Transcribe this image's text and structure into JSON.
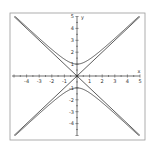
{
  "chart_data": {
    "type": "line",
    "title": "",
    "xlabel": "x",
    "ylabel": "y",
    "xlim": [
      -5,
      5
    ],
    "ylim": [
      -5,
      5
    ],
    "x_ticks": [
      -4,
      -3,
      -2,
      -1,
      1,
      2,
      3,
      4,
      5
    ],
    "y_ticks": [
      -4,
      -3,
      -2,
      -1,
      1,
      2,
      3,
      4,
      5
    ],
    "grid": false,
    "legend": null,
    "series": [
      {
        "name": "hyperbola upper branch",
        "equation": "y = sqrt(1 + x^2)",
        "x": [
          -5,
          -4,
          -3,
          -2,
          -1,
          0,
          1,
          2,
          3,
          4,
          5
        ],
        "values": [
          5.1,
          4.12,
          3.16,
          2.24,
          1.41,
          1.0,
          1.41,
          2.24,
          3.16,
          4.12,
          5.1
        ]
      },
      {
        "name": "hyperbola lower branch",
        "equation": "y = -sqrt(1 + x^2)",
        "x": [
          -5,
          -4,
          -3,
          -2,
          -1,
          0,
          1,
          2,
          3,
          4,
          5
        ],
        "values": [
          -5.1,
          -4.12,
          -3.16,
          -2.24,
          -1.41,
          -1.0,
          -1.41,
          -2.24,
          -3.16,
          -4.12,
          -5.1
        ]
      },
      {
        "name": "asymptote y = x",
        "equation": "y = x",
        "x": [
          -5,
          5
        ],
        "values": [
          -5,
          5
        ]
      },
      {
        "name": "asymptote y = -x",
        "equation": "y = -x",
        "x": [
          -5,
          5
        ],
        "values": [
          5,
          -5
        ]
      }
    ]
  },
  "colors": {
    "curve": "#333333",
    "frame": "#999999",
    "axis": "#333333"
  }
}
